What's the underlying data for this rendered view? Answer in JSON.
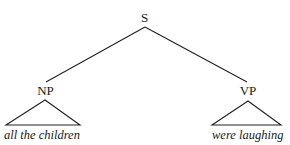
{
  "diagram": {
    "type": "syntax-tree",
    "root": {
      "label": "S",
      "children": [
        {
          "label": "NP",
          "leaf": "all the children",
          "collapsed_triangle": true
        },
        {
          "label": "VP",
          "leaf": "were laughing",
          "collapsed_triangle": true
        }
      ]
    },
    "nodes": {
      "s": "S",
      "np": "NP",
      "vp": "VP"
    },
    "leaves": {
      "np": "all the children",
      "vp": "were laughing"
    },
    "colors": {
      "line": "#222222",
      "text": "#1a1a1a",
      "background": "#ffffff"
    }
  }
}
